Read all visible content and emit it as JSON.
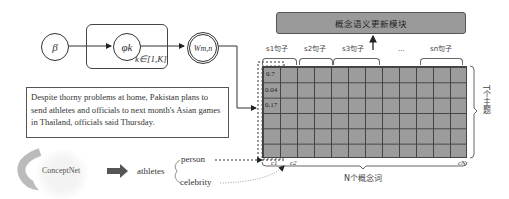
{
  "graphical_model": {
    "nodes": [
      {
        "id": "beta",
        "label": "β"
      },
      {
        "id": "phi",
        "label": "φk"
      },
      {
        "id": "w",
        "label": "Wm,n"
      }
    ],
    "plate_label": "k∈[1,K]"
  },
  "update_module": {
    "label": "概念语义更新模块"
  },
  "sentence_text": "Despite thorny problems at home, Pakistan plans to send athletes and officials to next month's Asian games in Thailand, officials said Thursday.",
  "conceptnet": {
    "label": "ConceptNet"
  },
  "mapping": {
    "word": "athletes",
    "concepts": [
      "person",
      "celebrity"
    ]
  },
  "matrix": {
    "sentence_labels": [
      "s1句子",
      "s2句子",
      "s3句子",
      "...",
      "sn句子"
    ],
    "column_values": [
      "0.7",
      "0.04",
      "0.17"
    ],
    "column_labels": [
      "c1",
      "c2",
      "cN"
    ],
    "row_axis_label": "T个主题",
    "col_axis_label": "N个概念词"
  }
}
